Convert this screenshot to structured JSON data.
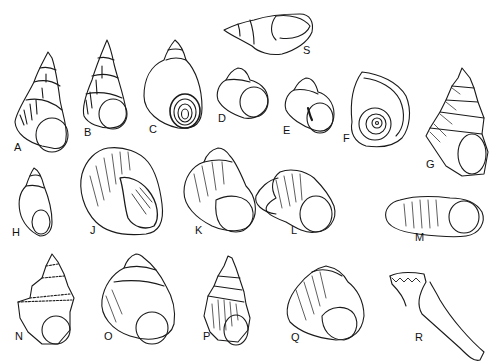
{
  "figure": {
    "ink_color": "#1a1a1a",
    "background": "#ffffff"
  },
  "labels": {
    "A": "A",
    "B": "B",
    "C": "C",
    "D": "D",
    "E": "E",
    "F": "F",
    "G": "G",
    "H": "H",
    "J": "J",
    "K": "K",
    "L": "L",
    "M": "M",
    "N": "N",
    "O": "O",
    "P": "P",
    "Q": "Q",
    "R": "R",
    "S": "S"
  }
}
